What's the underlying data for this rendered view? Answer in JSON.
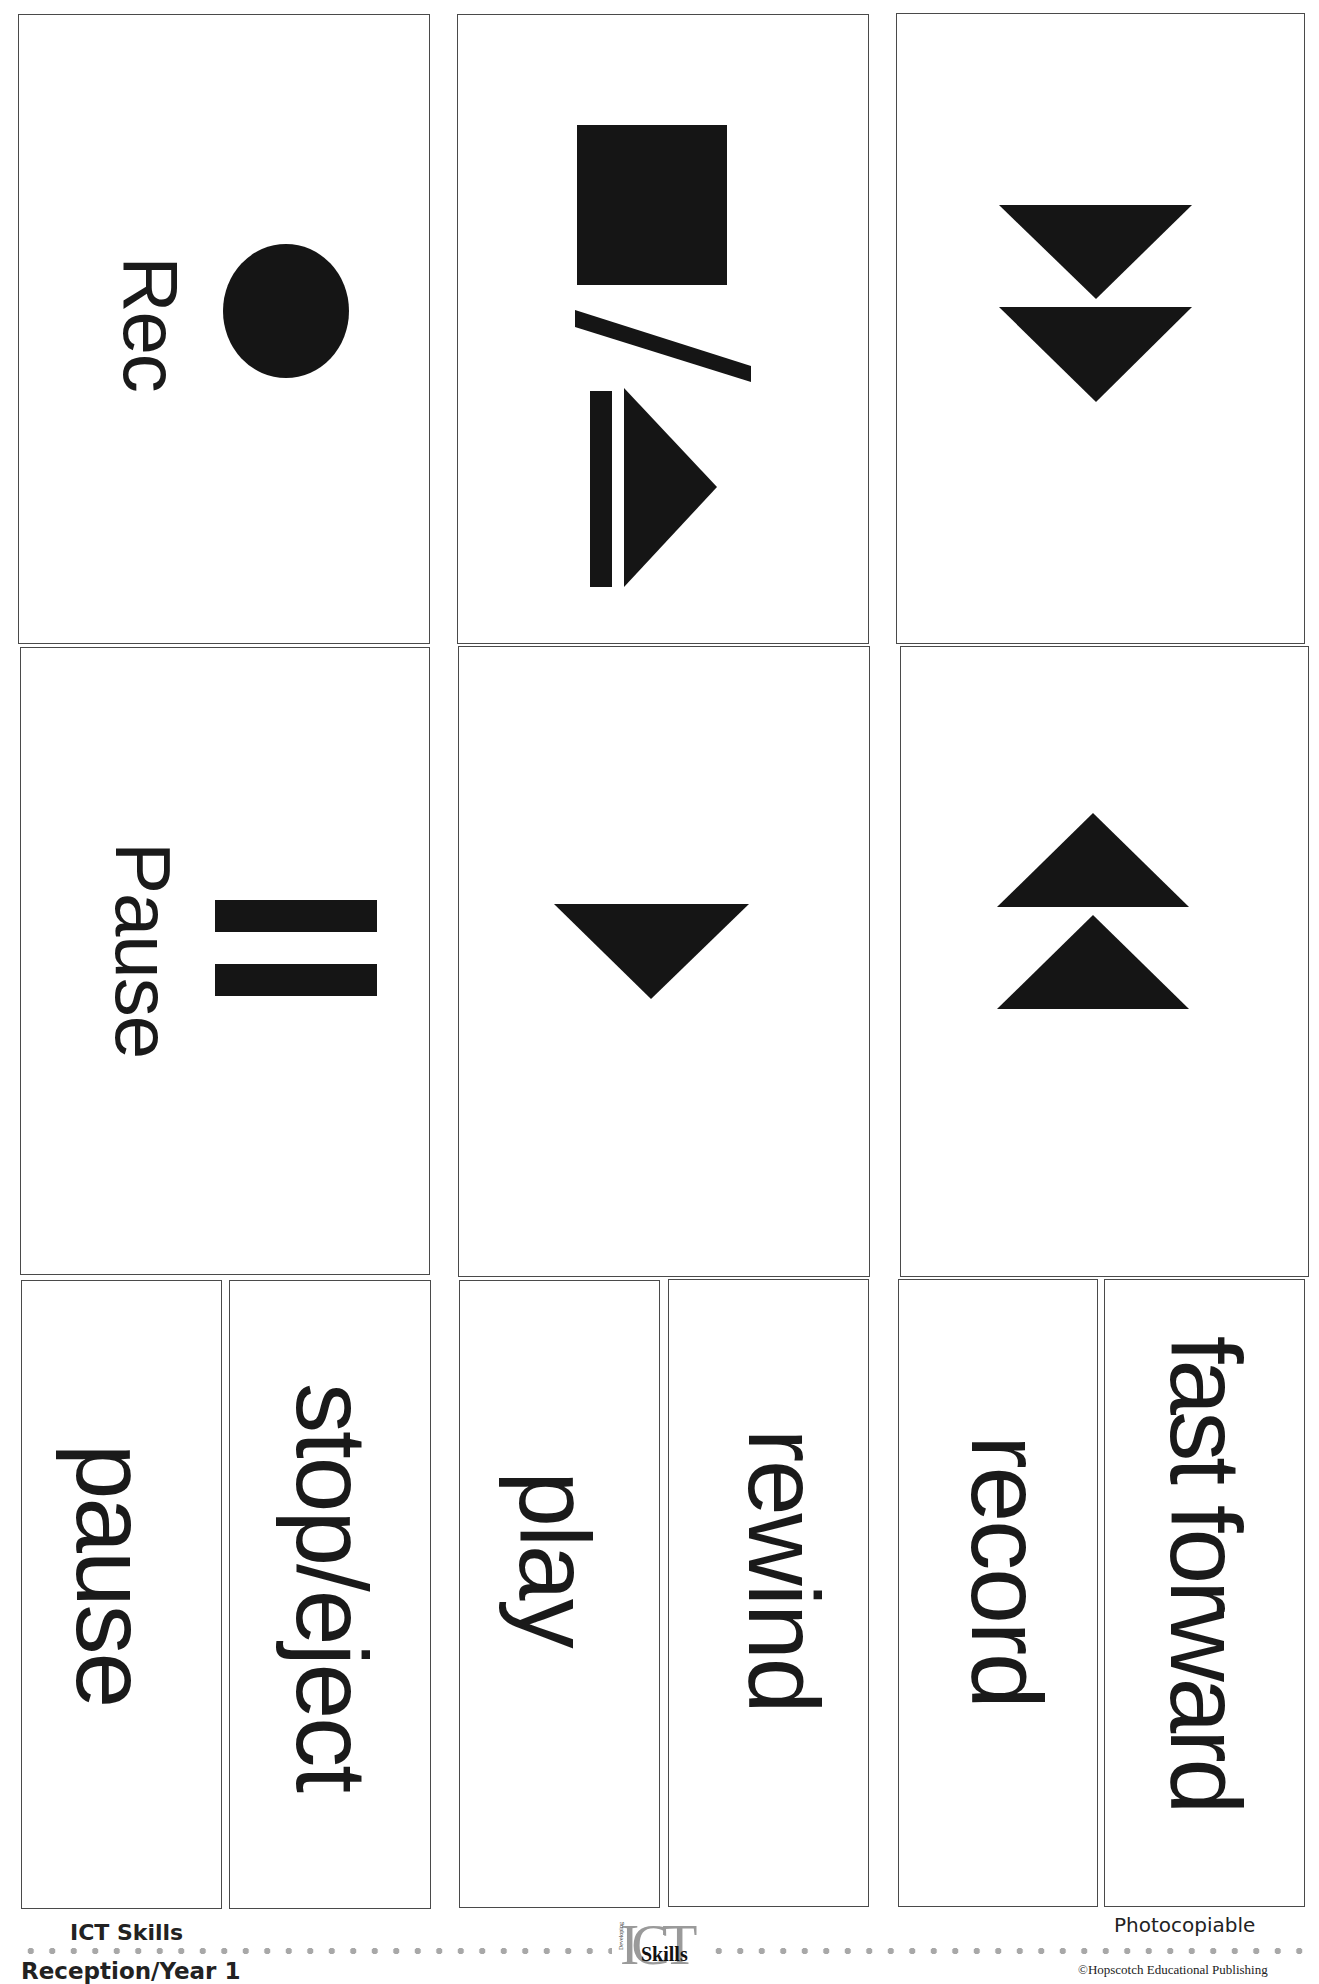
{
  "worksheet": {
    "symbol_cards": [
      {
        "id": "rec",
        "label": "Rec",
        "icon": "record-circle-icon"
      },
      {
        "id": "stop-eject",
        "label": "",
        "icon": "stop-eject-icon"
      },
      {
        "id": "fast-forward",
        "label": "",
        "icon": "fast-forward-icon"
      },
      {
        "id": "pause",
        "label": "Pause",
        "icon": "pause-bars-icon"
      },
      {
        "id": "play",
        "label": "",
        "icon": "play-triangle-icon"
      },
      {
        "id": "rewind",
        "label": "",
        "icon": "rewind-icon"
      }
    ],
    "word_cards": [
      {
        "id": "word-pause",
        "label": "pause"
      },
      {
        "id": "word-stop-eject",
        "label": "stop/eject"
      },
      {
        "id": "word-play",
        "label": "play"
      },
      {
        "id": "word-rewind",
        "label": "rewind"
      },
      {
        "id": "word-record",
        "label": "record"
      },
      {
        "id": "word-fast-forward",
        "label": "fast forward"
      }
    ]
  },
  "footer": {
    "series": "ICT Skills",
    "level": "Reception/Year 1",
    "photocopiable": "Photocopiable",
    "copyright": "©Hopscotch Educational Publishing",
    "logo": {
      "big": "ICT",
      "word": "Skills",
      "vertical": "Developing"
    }
  },
  "colors": {
    "ink": "#151515",
    "border": "#4a4a4a",
    "dots": "#a8a8a8",
    "logo_grey": "#9a9a9a",
    "paper": "#ffffff"
  }
}
